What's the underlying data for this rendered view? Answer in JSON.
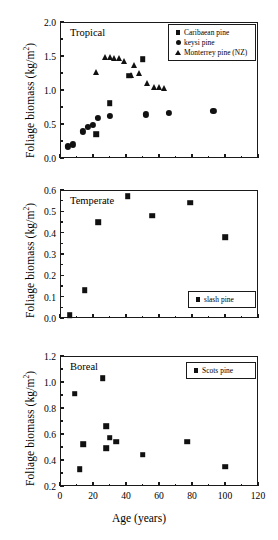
{
  "figure": {
    "xlabel": "Age (years)",
    "ylabel_text": "Foliage biomass (kg/m",
    "ylabel_sup": "2",
    "ylabel_close": ")"
  },
  "chart_data": [
    {
      "type": "scatter",
      "title": "Tropical",
      "xlabel": "",
      "ylabel": "Foliage biomass (kg/m 2 )",
      "xlim": [
        0,
        120
      ],
      "ylim": [
        0.0,
        2.0
      ],
      "xticks": [
        0,
        20,
        40,
        60,
        80,
        100,
        120
      ],
      "xticklabels": [
        "",
        "",
        "",
        "",
        "",
        "",
        ""
      ],
      "yticks": [
        0.0,
        0.5,
        1.0,
        1.5,
        2.0
      ],
      "yticklabels": [
        "0.0",
        "0.5",
        "1.0",
        "1.5",
        "2.0"
      ],
      "grid": false,
      "legend_position": "upper right",
      "series": [
        {
          "name": "Caribaean pine",
          "marker": "square",
          "points": [
            [
              22,
              0.35
            ],
            [
              30,
              0.81
            ],
            [
              42,
              1.21
            ],
            [
              50,
              1.45
            ],
            [
              68,
              1.83
            ]
          ]
        },
        {
          "name": "keysi pine",
          "marker": "circle",
          "points": [
            [
              5,
              0.17
            ],
            [
              8,
              0.2
            ],
            [
              14,
              0.39
            ],
            [
              17,
              0.46
            ],
            [
              20,
              0.49
            ],
            [
              23,
              0.59
            ],
            [
              30,
              0.62
            ],
            [
              52,
              0.64
            ],
            [
              66,
              0.66
            ],
            [
              93,
              0.69
            ]
          ]
        },
        {
          "name": "Monterrey pine (NZ)",
          "marker": "triangle",
          "points": [
            [
              22,
              1.26
            ],
            [
              27,
              1.48
            ],
            [
              30,
              1.48
            ],
            [
              33,
              1.47
            ],
            [
              36,
              1.47
            ],
            [
              39,
              1.42
            ],
            [
              43,
              1.22
            ],
            [
              45,
              1.37
            ],
            [
              48,
              1.25
            ],
            [
              53,
              1.11
            ],
            [
              57,
              1.05
            ],
            [
              60,
              1.04
            ],
            [
              63,
              1.03
            ]
          ]
        }
      ]
    },
    {
      "type": "scatter",
      "title": "Temperate",
      "xlabel": "",
      "ylabel": "Foliage biomass (kg/m 2 )",
      "xlim": [
        0,
        120
      ],
      "ylim": [
        0.0,
        0.6
      ],
      "xticks": [
        0,
        20,
        40,
        60,
        80,
        100,
        120
      ],
      "xticklabels": [
        "",
        "",
        "",
        "",
        "",
        "",
        ""
      ],
      "yticks": [
        0.0,
        0.1,
        0.2,
        0.3,
        0.4,
        0.5,
        0.6
      ],
      "yticklabels": [
        "0.0",
        "0.1",
        "0.2",
        "0.3",
        "0.4",
        "0.5",
        "0.6"
      ],
      "grid": false,
      "legend_position": "lower right",
      "series": [
        {
          "name": "slash pine",
          "marker": "square",
          "points": [
            [
              6,
              0.012
            ],
            [
              15,
              0.13
            ],
            [
              23,
              0.45
            ],
            [
              41,
              0.57
            ],
            [
              56,
              0.48
            ],
            [
              79,
              0.54
            ],
            [
              100,
              0.38
            ]
          ]
        }
      ]
    },
    {
      "type": "scatter",
      "title": "Boreal",
      "xlabel": "Age (years)",
      "ylabel": "Foliage biomass (kg/m 2 )",
      "xlim": [
        0,
        120
      ],
      "ylim": [
        0.2,
        1.2
      ],
      "xticks": [
        0,
        20,
        40,
        60,
        80,
        100,
        120
      ],
      "xticklabels": [
        "0",
        "20",
        "40",
        "60",
        "80",
        "100",
        "120"
      ],
      "yticks": [
        0.2,
        0.4,
        0.6,
        0.8,
        1.0,
        1.2
      ],
      "yticklabels": [
        "0.2",
        "0.4",
        "0.6",
        "0.8",
        "1.0",
        "1.2"
      ],
      "grid": false,
      "legend_position": "upper right",
      "series": [
        {
          "name": "Scots pine",
          "marker": "square",
          "points": [
            [
              9,
              0.91
            ],
            [
              12,
              0.33
            ],
            [
              14,
              0.52
            ],
            [
              26,
              1.03
            ],
            [
              28,
              0.66
            ],
            [
              28,
              0.49
            ],
            [
              30,
              0.57
            ],
            [
              34,
              0.54
            ],
            [
              50,
              0.44
            ],
            [
              77,
              0.54
            ],
            [
              100,
              0.35
            ]
          ]
        }
      ]
    }
  ],
  "legends": {
    "tropical": [
      {
        "label": "Caribaean pine",
        "marker": "sq"
      },
      {
        "label": "keysi pine",
        "marker": "ci"
      },
      {
        "label": "Monterrey pine (NZ)",
        "marker": "tr"
      }
    ],
    "temperate": [
      {
        "label": "slash pine",
        "marker": "sq"
      }
    ],
    "boreal": [
      {
        "label": "Scots pine",
        "marker": "sq"
      }
    ]
  },
  "colors": {
    "marker": "#111111",
    "axis": "#1a1a1a",
    "background": "#ffffff"
  }
}
